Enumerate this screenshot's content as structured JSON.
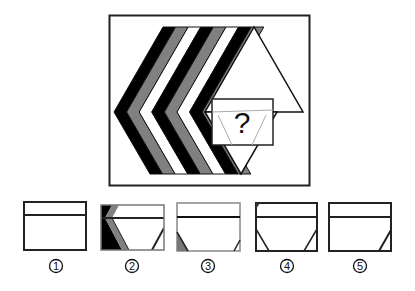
{
  "puzzle": {
    "question_mark": "?",
    "band_colors": [
      "#000000",
      "#808080",
      "#ffffff",
      "#000000",
      "#808080",
      "#ffffff",
      "#000000",
      "#808080"
    ],
    "triangle_fill": "#ffffff"
  },
  "options": [
    {
      "label": "1",
      "number": "①"
    },
    {
      "label": "2",
      "number": "②"
    },
    {
      "label": "3",
      "number": "③"
    },
    {
      "label": "4",
      "number": "④"
    },
    {
      "label": "5",
      "number": "⑤"
    }
  ]
}
